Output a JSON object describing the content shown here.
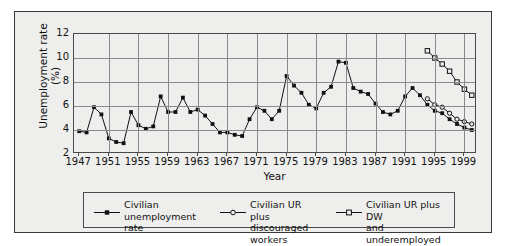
{
  "chart_data": {
    "type": "line",
    "title": "",
    "xlabel": "Year",
    "ylabel": "Unemployment\nrate (%)",
    "xlim": [
      1946.3,
      2000.7
    ],
    "ylim": [
      2,
      12
    ],
    "yticks": [
      2,
      4,
      6,
      8,
      10,
      12
    ],
    "xticks": [
      1947,
      1951,
      1955,
      1959,
      1963,
      1967,
      1971,
      1975,
      1979,
      1983,
      1987,
      1991,
      1995,
      1999
    ],
    "grid": "both",
    "legend_position": "below-axes",
    "series": [
      {
        "name": "Civilian\nunemployment rate",
        "marker": "filled-square",
        "color": "#111111",
        "x": [
          1947,
          1948,
          1949,
          1950,
          1951,
          1952,
          1953,
          1954,
          1955,
          1956,
          1957,
          1958,
          1959,
          1960,
          1961,
          1962,
          1963,
          1964,
          1965,
          1966,
          1967,
          1968,
          1969,
          1970,
          1971,
          1972,
          1973,
          1974,
          1975,
          1976,
          1977,
          1978,
          1979,
          1980,
          1981,
          1982,
          1983,
          1984,
          1985,
          1986,
          1987,
          1988,
          1989,
          1990,
          1991,
          1992,
          1993,
          1994,
          1995,
          1996,
          1997,
          1998,
          1999,
          2000
        ],
        "values": [
          3.9,
          3.8,
          5.9,
          5.3,
          3.3,
          3.0,
          2.9,
          5.5,
          4.4,
          4.1,
          4.3,
          6.8,
          5.5,
          5.5,
          6.7,
          5.5,
          5.7,
          5.2,
          4.5,
          3.8,
          3.8,
          3.6,
          3.5,
          4.9,
          5.9,
          5.6,
          4.9,
          5.6,
          8.5,
          7.7,
          7.1,
          6.1,
          5.8,
          7.1,
          7.6,
          9.7,
          9.6,
          7.5,
          7.2,
          7.0,
          6.2,
          5.5,
          5.3,
          5.6,
          6.8,
          7.5,
          6.9,
          6.1,
          5.6,
          5.4,
          4.9,
          4.5,
          4.2,
          4.0
        ]
      },
      {
        "name": "Civilian UR plus\ndiscouraged workers",
        "marker": "open-circle",
        "color": "#111111",
        "x": [
          1994,
          1995,
          1996,
          1997,
          1998,
          1999,
          2000
        ],
        "values": [
          6.6,
          6.1,
          5.9,
          5.4,
          4.9,
          4.7,
          4.5
        ]
      },
      {
        "name": "Civilian UR plus DW\nand underemployed",
        "marker": "open-square",
        "color": "#111111",
        "x": [
          1994,
          1995,
          1996,
          1997,
          1998,
          1999,
          2000
        ],
        "values": [
          10.6,
          10.0,
          9.5,
          8.9,
          8.0,
          7.4,
          6.9
        ]
      }
    ]
  }
}
